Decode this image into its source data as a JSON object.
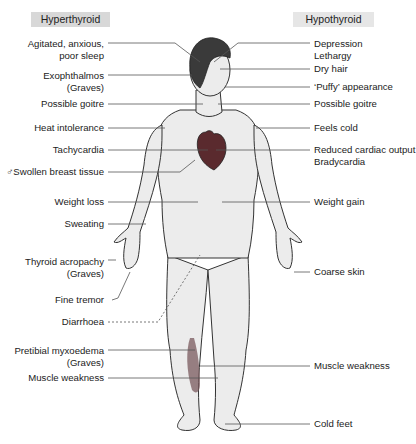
{
  "headers": {
    "hyperthyroid": "Hyperthyroid",
    "hypothyroid": "Hypothyroid"
  },
  "hyperthyroid_signs": [
    {
      "line1": "Agitated, anxious,",
      "line2": "poor sleep"
    },
    {
      "line1": "Exophthalmos",
      "line2": "(Graves)"
    },
    {
      "line1": "Possible goitre",
      "line2": ""
    },
    {
      "line1": "Heat intolerance",
      "line2": ""
    },
    {
      "line1": "Tachycardia",
      "line2": ""
    },
    {
      "line1": "♂Swollen breast tissue",
      "line2": ""
    },
    {
      "line1": "Weight loss",
      "line2": ""
    },
    {
      "line1": "Sweating",
      "line2": ""
    },
    {
      "line1": "Thyroid acropachy",
      "line2": "(Graves)"
    },
    {
      "line1": "Fine tremor",
      "line2": ""
    },
    {
      "line1": "Diarrhoea",
      "line2": ""
    },
    {
      "line1": "Pretibial myxoedema",
      "line2": "(Graves)"
    },
    {
      "line1": "Muscle weakness",
      "line2": ""
    }
  ],
  "hypothyroid_signs": [
    {
      "line1": "Depression",
      "line2": "Lethargy"
    },
    {
      "line1": "Dry hair",
      "line2": ""
    },
    {
      "line1": "‘Puffy’ appearance",
      "line2": ""
    },
    {
      "line1": "Possible goitre",
      "line2": ""
    },
    {
      "line1": "Feels cold",
      "line2": ""
    },
    {
      "line1": "Reduced cardiac output",
      "line2": "Bradycardia"
    },
    {
      "line1": "Weight gain",
      "line2": ""
    },
    {
      "line1": "Coarse skin",
      "line2": ""
    },
    {
      "line1": "Muscle weakness",
      "line2": ""
    },
    {
      "line1": "Cold feet",
      "line2": ""
    }
  ],
  "figure": {
    "colors": {
      "skin": "#ececec",
      "outline": "#333333",
      "hair": "#3a3a3a",
      "heart": "#5a2a2e",
      "muscle": "#7a5a5e",
      "leader_line": "#555555",
      "hyper_header_bg": "#d8d8d8",
      "hypo_header_bg": "#e6e6e6"
    }
  }
}
